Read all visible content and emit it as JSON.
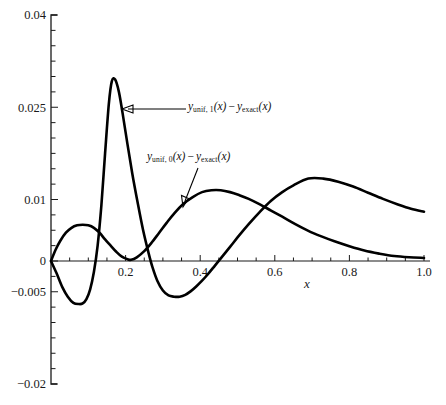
{
  "figure": {
    "name": "error-comparison-plot",
    "background": "#ffffff",
    "ink_color": "#000000"
  },
  "annotations": [
    {
      "id": "unif1",
      "prefix": "y",
      "subscript": "unif, 1",
      "arg": "(x)",
      "operator": "−",
      "second": "y",
      "second_subscript": "exact",
      "second_arg": "(x)",
      "full_text": "y_unif,1(x) − y_exact(x)",
      "leader": "arrow-left"
    },
    {
      "id": "unif0",
      "prefix": "y",
      "subscript": "unif, 0",
      "arg": "(x)",
      "operator": "−",
      "second": "y",
      "second_subscript": "exact",
      "second_arg": "(x)",
      "full_text": "y_unif,0(x) − y_exact(x)",
      "leader": "line-down-left"
    }
  ],
  "chart_data": {
    "type": "line",
    "title": "",
    "xlabel": "x",
    "ylabel": "",
    "xlim": [
      0,
      1.0
    ],
    "ylim": [
      -0.02,
      0.04
    ],
    "grid": false,
    "legend": "inline-annotations",
    "xticks": [
      0.2,
      0.4,
      0.6,
      0.8,
      1.0
    ],
    "xtick_labels": [
      "0.2",
      "0.4",
      "0.6",
      "0.8",
      "1.0"
    ],
    "xminor_step": 0.05,
    "yticks": [
      0.04,
      0.025,
      0.01,
      0,
      -0.005,
      -0.02
    ],
    "ytick_labels": [
      "0.04",
      "0.025",
      "0.01",
      "0",
      "−0.005",
      "−0.02"
    ],
    "yminor_step": 0.0025,
    "series": [
      {
        "name": "y_unif,1(x) − y_exact(x)",
        "color": "#000000",
        "x": [
          0.0,
          0.015,
          0.03,
          0.045,
          0.06,
          0.075,
          0.085,
          0.095,
          0.105,
          0.115,
          0.125,
          0.135,
          0.145,
          0.155,
          0.163,
          0.172,
          0.182,
          0.192,
          0.205,
          0.218,
          0.232,
          0.247,
          0.262,
          0.272,
          0.285,
          0.3,
          0.315,
          0.33,
          0.345,
          0.36,
          0.375,
          0.39,
          0.405,
          0.42,
          0.44,
          0.46,
          0.48,
          0.505,
          0.53,
          0.56,
          0.59,
          0.62,
          0.65,
          0.69,
          0.73,
          0.77,
          0.81,
          0.85,
          0.89,
          0.93,
          0.965,
          1.0
        ],
        "y": [
          0.0,
          -0.002,
          -0.0042,
          -0.0058,
          -0.0068,
          -0.007,
          -0.0069,
          -0.0062,
          -0.0046,
          -0.0018,
          0.0025,
          0.009,
          0.0175,
          0.0255,
          0.0292,
          0.0295,
          0.0275,
          0.024,
          0.019,
          0.0142,
          0.0096,
          0.005,
          0.0012,
          -0.001,
          -0.0032,
          -0.0048,
          -0.0056,
          -0.0058,
          -0.0058,
          -0.0055,
          -0.0049,
          -0.0041,
          -0.0032,
          -0.0022,
          -0.0007,
          0.0008,
          0.0023,
          0.0042,
          0.006,
          0.008,
          0.0098,
          0.0112,
          0.0123,
          0.0134,
          0.0134,
          0.0129,
          0.0121,
          0.0111,
          0.0101,
          0.0092,
          0.0085,
          0.008
        ]
      },
      {
        "name": "y_unif,0(x) − y_exact(x)",
        "color": "#000000",
        "x": [
          0.0,
          0.012,
          0.025,
          0.04,
          0.055,
          0.07,
          0.085,
          0.1,
          0.115,
          0.13,
          0.145,
          0.16,
          0.175,
          0.19,
          0.205,
          0.215,
          0.23,
          0.25,
          0.27,
          0.29,
          0.31,
          0.33,
          0.355,
          0.38,
          0.405,
          0.43,
          0.455,
          0.48,
          0.505,
          0.53,
          0.56,
          0.59,
          0.62,
          0.655,
          0.69,
          0.725,
          0.76,
          0.8,
          0.84,
          0.88,
          0.92,
          0.96,
          1.0
        ],
        "y": [
          0.0,
          0.0018,
          0.0033,
          0.0046,
          0.0054,
          0.0058,
          0.0059,
          0.0058,
          0.0054,
          0.0046,
          0.0035,
          0.0025,
          0.0015,
          0.0007,
          0.0003,
          0.0002,
          0.0006,
          0.0016,
          0.003,
          0.0046,
          0.0062,
          0.0077,
          0.0093,
          0.0104,
          0.0112,
          0.0115,
          0.0115,
          0.0112,
          0.0107,
          0.0101,
          0.0092,
          0.0082,
          0.0072,
          0.006,
          0.0049,
          0.004,
          0.0032,
          0.0024,
          0.0017,
          0.0012,
          0.0008,
          0.0006,
          0.0005
        ]
      }
    ]
  }
}
